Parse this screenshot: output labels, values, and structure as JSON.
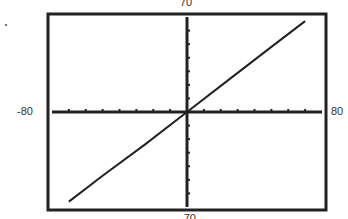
{
  "chart_data": {
    "type": "line",
    "title": "",
    "xlabel": "",
    "ylabel": "",
    "xlim": [
      -80,
      80
    ],
    "ylim": [
      -70,
      70
    ],
    "x_tick_spacing": 10,
    "y_tick_spacing": 10,
    "grid": false,
    "window_labels": {
      "ymax": "70",
      "ymin": "-70",
      "xmin": "-80",
      "xmax": "80"
    },
    "series": [
      {
        "name": "y = x",
        "x": [
          -70,
          -50,
          -25,
          0,
          25,
          50,
          70
        ],
        "y": [
          -66,
          -47,
          -24,
          0,
          24,
          48,
          67
        ]
      }
    ],
    "line_color": "#222222"
  }
}
